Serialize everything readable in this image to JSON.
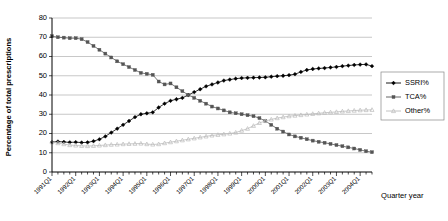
{
  "chart_data": {
    "type": "line",
    "title": "",
    "xlabel": "Quarter year",
    "ylabel": "Percentage of total prescriptions",
    "ylim": [
      0,
      80
    ],
    "ytick_labels": [
      "0",
      "10",
      "20",
      "30",
      "40",
      "50",
      "60",
      "70",
      "80"
    ],
    "ytick_values": [
      0,
      10,
      20,
      30,
      40,
      50,
      60,
      70,
      80
    ],
    "grid": true,
    "legend_position": "right",
    "xtick_labels": [
      "1991Q1",
      "1992Q1",
      "1993Q1",
      "1994Q1",
      "1995Q1",
      "1996Q1",
      "1997Q1",
      "1998Q1",
      "1999Q1",
      "2000Q1",
      "2001Q1",
      "2002Q1",
      "2003Q1",
      "2004Q1"
    ],
    "x": [
      "1991Q1",
      "1991Q2",
      "1991Q3",
      "1991Q4",
      "1992Q1",
      "1992Q2",
      "1992Q3",
      "1992Q4",
      "1993Q1",
      "1993Q2",
      "1993Q3",
      "1993Q4",
      "1994Q1",
      "1994Q2",
      "1994Q3",
      "1994Q4",
      "1995Q1",
      "1995Q2",
      "1995Q3",
      "1995Q4",
      "1996Q1",
      "1996Q2",
      "1996Q3",
      "1996Q4",
      "1997Q1",
      "1997Q2",
      "1997Q3",
      "1997Q4",
      "1998Q1",
      "1998Q2",
      "1998Q3",
      "1998Q4",
      "1999Q1",
      "1999Q2",
      "1999Q3",
      "1999Q4",
      "2000Q1",
      "2000Q2",
      "2000Q3",
      "2000Q4",
      "2001Q1",
      "2001Q2",
      "2001Q3",
      "2001Q4",
      "2002Q1",
      "2002Q2",
      "2002Q3",
      "2002Q4",
      "2003Q1",
      "2003Q2",
      "2003Q3",
      "2003Q4",
      "2004Q1",
      "2004Q2",
      "2004Q3"
    ],
    "series": [
      {
        "name": "SSRI%",
        "color": "#000000",
        "marker": "filled-diamond",
        "values": [
          15.5,
          15.8,
          15.6,
          15.4,
          15.5,
          15.3,
          15.4,
          16.0,
          17.0,
          18.5,
          20.5,
          22.5,
          24.5,
          26.5,
          28.5,
          30.0,
          30.5,
          31.0,
          33.5,
          35.5,
          37.0,
          37.8,
          38.5,
          40.0,
          41.5,
          43.0,
          44.5,
          45.5,
          46.5,
          47.5,
          48.0,
          48.5,
          48.8,
          48.9,
          49.0,
          49.1,
          49.2,
          49.5,
          49.8,
          50.0,
          50.3,
          50.8,
          52.0,
          53.0,
          53.5,
          53.8,
          54.0,
          54.3,
          54.6,
          55.0,
          55.3,
          55.6,
          55.8,
          55.9,
          55.0
        ]
      },
      {
        "name": "TCA%",
        "color": "#555555",
        "marker": "filled-square",
        "values": [
          70.5,
          70.0,
          69.8,
          69.5,
          69.5,
          69.0,
          67.5,
          65.5,
          63.5,
          61.5,
          59.5,
          57.5,
          56.0,
          54.5,
          53.0,
          51.5,
          51.0,
          50.5,
          47.0,
          45.5,
          46.0,
          44.0,
          42.0,
          40.0,
          38.5,
          37.0,
          35.5,
          34.0,
          33.0,
          32.0,
          31.0,
          30.5,
          30.0,
          29.5,
          29.0,
          28.0,
          26.5,
          24.5,
          22.5,
          21.0,
          19.5,
          18.5,
          17.8,
          17.0,
          16.3,
          15.7,
          15.2,
          14.6,
          14.0,
          13.4,
          12.8,
          12.2,
          11.5,
          10.8,
          10.3
        ]
      },
      {
        "name": "Other%",
        "color": "#bbbbbb",
        "marker": "open-triangle",
        "values": [
          15.5,
          15.0,
          14.5,
          14.0,
          13.8,
          13.6,
          13.5,
          13.6,
          13.8,
          14.0,
          14.2,
          14.3,
          14.5,
          14.6,
          14.7,
          14.8,
          14.5,
          14.3,
          14.5,
          15.0,
          15.5,
          16.0,
          16.5,
          17.0,
          17.5,
          18.0,
          18.5,
          19.0,
          19.3,
          19.6,
          20.0,
          20.5,
          21.5,
          22.5,
          24.0,
          25.5,
          26.5,
          27.3,
          28.0,
          28.5,
          29.0,
          29.3,
          29.6,
          29.9,
          30.2,
          30.5,
          30.8,
          31.0,
          31.2,
          31.5,
          31.7,
          31.9,
          32.1,
          32.2,
          32.3
        ]
      }
    ]
  },
  "legend": {
    "items": [
      {
        "label": "SSRI%"
      },
      {
        "label": "TCA%"
      },
      {
        "label": "Other%"
      }
    ]
  }
}
